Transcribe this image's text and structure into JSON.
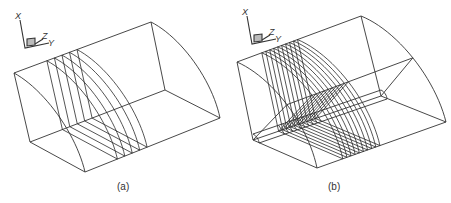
{
  "figure": {
    "panels": [
      {
        "id": "a",
        "caption": "(a)",
        "axes": {
          "x_label": "X",
          "y_label": "Y",
          "z_label": "Z",
          "origin": [
            25,
            48
          ]
        },
        "body": {
          "front_top": [
            14,
            73
          ],
          "front_left_bottom": [
            30,
            142
          ],
          "front_bottom": [
            85,
            172
          ],
          "back_top": [
            151,
            22
          ],
          "back_inner": [
            165,
            90
          ],
          "back_bottom": [
            220,
            118
          ]
        },
        "ring_count": 5,
        "ring_t_start": 0.24,
        "ring_t_step": 0.055,
        "radial_lines": false
      },
      {
        "id": "b",
        "caption": "(b)",
        "axes": {
          "x_label": "X",
          "y_label": "Y",
          "z_label": "Z",
          "origin": [
            252,
            44
          ]
        },
        "body": {
          "front_top": [
            237,
            62
          ],
          "front_left_bottom": [
            253,
            140
          ],
          "front_bottom": [
            317,
            168
          ],
          "back_top": [
            361,
            16
          ],
          "back_inner": [
            381,
            96
          ],
          "back_bottom": [
            446,
            122
          ]
        },
        "ring_count": 10,
        "ring_t_start": 0.2,
        "ring_t_step": 0.032,
        "radial_lines": true
      }
    ],
    "stroke_color": "#333333",
    "background": "#ffffff"
  }
}
